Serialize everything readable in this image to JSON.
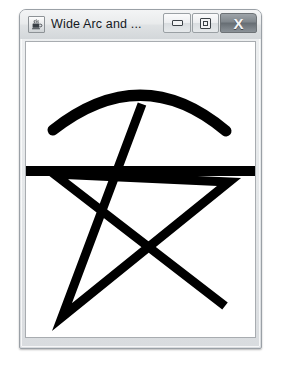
{
  "window": {
    "title": "Wide Arc and ...",
    "app_icon": "java-coffee-cup-icon",
    "buttons": {
      "minimize": "minimize-button",
      "maximize": "maximize-restore-button",
      "close": "X"
    }
  },
  "canvas": {
    "background_color": "#ffffff",
    "stroke_color": "#000000",
    "width": 229,
    "height": 295,
    "shapes": [
      {
        "name": "wide-arc",
        "type": "arc",
        "stroke_width": 11,
        "path": "M 27 88 Q 116 18 200 89"
      },
      {
        "name": "horizontal-line",
        "type": "line",
        "stroke_width": 10,
        "x1": -2,
        "y1": 129,
        "x2": 231,
        "y2": 129
      },
      {
        "name": "star-polyline",
        "type": "polyline",
        "stroke_width": 9,
        "points": "116 62, 36 275, 203 140, 28 132, 199 264"
      }
    ]
  }
}
